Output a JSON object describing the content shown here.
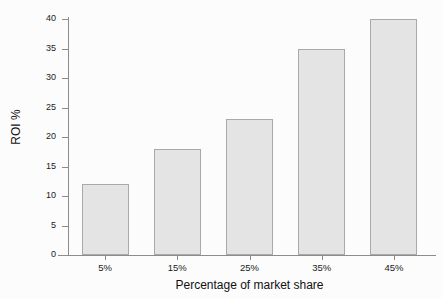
{
  "chart_data": {
    "type": "bar",
    "title": "",
    "xlabel": "Percentage of market share",
    "ylabel": "ROI %",
    "categories": [
      "5%",
      "15%",
      "25%",
      "35%",
      "45%"
    ],
    "values": [
      12,
      18,
      23,
      35,
      40
    ],
    "ylim": [
      0,
      40
    ],
    "yticks": [
      0,
      5,
      10,
      15,
      20,
      25,
      30,
      35,
      40
    ],
    "ytick_labels": [
      "0",
      "5",
      "10",
      "15",
      "20",
      "25",
      "30",
      "35",
      "40"
    ],
    "grid": false,
    "legend": "none",
    "bar_fill_color": "#e4e4e4",
    "bar_border_color": "#a9a9a9",
    "axis_color": "#8c8c8c",
    "background_color": "#fcfcfc",
    "series": [
      {
        "name": "ROI %",
        "values": [
          12,
          18,
          23,
          35,
          40
        ]
      }
    ]
  }
}
